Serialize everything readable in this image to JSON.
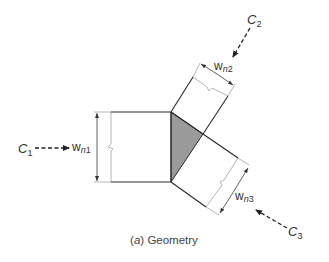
{
  "caption": {
    "prefix": "(",
    "letter": "a",
    "suffix": ") Geometry"
  },
  "forces": [
    {
      "id": "C1",
      "main": "C",
      "sub": "1"
    },
    {
      "id": "C2",
      "main": "C",
      "sub": "2"
    },
    {
      "id": "C3",
      "main": "C",
      "sub": "3"
    }
  ],
  "widths": [
    {
      "id": "wn1",
      "main": "w",
      "sub_n": "n",
      "sub_num": "1"
    },
    {
      "id": "wn2",
      "main": "w",
      "sub_n": "n",
      "sub_num": "2"
    },
    {
      "id": "wn3",
      "main": "w",
      "sub_n": "n",
      "sub_num": "3"
    }
  ],
  "colors": {
    "nodal_zone_fill": "#9a9a9a",
    "line": "#2a2a2a"
  }
}
